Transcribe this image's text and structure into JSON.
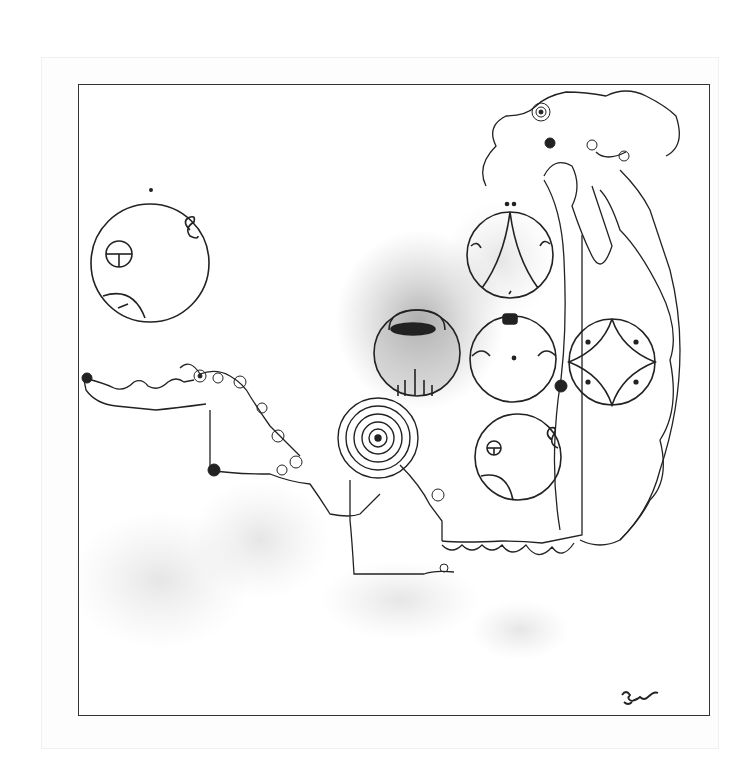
{
  "artwork": {
    "title": "",
    "type": "ink drawing",
    "signature": {
      "legible": false
    },
    "colors": {
      "ink": "#222222",
      "paper": "#ffffff",
      "shade": "#888888"
    }
  }
}
